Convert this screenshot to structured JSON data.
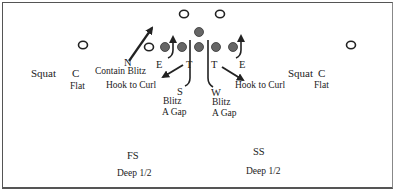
{
  "diagram": {
    "title": "",
    "colors": {
      "line": "#222222",
      "filled_player": "#666666",
      "border": "#555555"
    },
    "offense": {
      "receivers_top": [
        {
          "x": 184,
          "y": 14
        },
        {
          "x": 220,
          "y": 14
        }
      ],
      "wide_left": {
        "x": 83,
        "y": 45
      },
      "wide_right": {
        "x": 351,
        "y": 45
      },
      "slot_left": {
        "x": 149,
        "y": 47
      },
      "linemen": [
        {
          "x": 165,
          "y": 47
        },
        {
          "x": 182,
          "y": 47
        },
        {
          "x": 199,
          "y": 47
        },
        {
          "x": 216,
          "y": 47
        },
        {
          "x": 233,
          "y": 47
        }
      ],
      "center_top": {
        "x": 199,
        "y": 32
      }
    },
    "defense": {
      "left_corner": {
        "position": "C",
        "squat_label": "Squat",
        "assignment": "Flat"
      },
      "right_corner": {
        "position": "C",
        "squat_label": "Squat",
        "assignment": "Flat"
      },
      "nose": {
        "position": "N",
        "assignment": "Contain Blitz"
      },
      "left_end": {
        "position": "E"
      },
      "right_end": {
        "position": "E"
      },
      "left_tackle": {
        "position": "T",
        "assignment": "Hook to Curl"
      },
      "right_tackle": {
        "position": "T",
        "assignment": "Hook to Curl"
      },
      "strong_lb": {
        "position": "S",
        "assignment_line1": "Blitz",
        "assignment_line2": "A Gap"
      },
      "weak_lb": {
        "position": "W",
        "assignment_line1": "Blitz",
        "assignment_line2": "A Gap"
      },
      "free_safety": {
        "position": "FS",
        "assignment": "Deep 1/2"
      },
      "strong_safety": {
        "position": "SS",
        "assignment": "Deep 1/2"
      }
    }
  }
}
